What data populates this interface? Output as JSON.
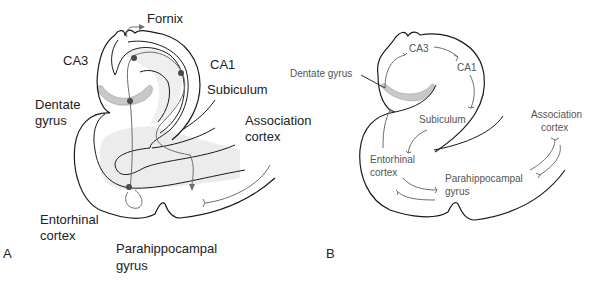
{
  "panel_a": {
    "letter": "A",
    "labels": {
      "fornix": "Fornix",
      "ca3": "CA3",
      "ca1": "CA1",
      "subiculum": "Subiculum",
      "dentate_line1": "Dentate",
      "dentate_line2": "gyrus",
      "association_line1": "Association",
      "association_line2": "cortex",
      "entorhinal_line1": "Entorhinal",
      "entorhinal_line2": "cortex",
      "parahippocampal_line1": "Parahippocampal",
      "parahippocampal_line2": "gyrus"
    }
  },
  "panel_b": {
    "letter": "B",
    "labels": {
      "ca3": "CA3",
      "ca1": "CA1",
      "dentate": "Dentate gyrus",
      "subiculum": "Subiculum",
      "association_line1": "Association",
      "association_line2": "cortex",
      "entorhinal_line1": "Entorhinal",
      "entorhinal_line2": "cortex",
      "parahippocampal_line1": "Parahippocampal",
      "parahippocampal_line2": "gyrus"
    }
  },
  "colors": {
    "outline": "#1a1a1a",
    "pathway": "#6e6e6e",
    "dentate_fill": "#c8c8c8",
    "cortex_fill": "#ececec",
    "neuron": "#4a4a4a"
  }
}
